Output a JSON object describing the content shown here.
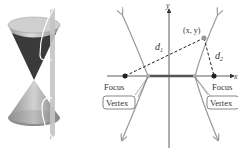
{
  "figure": {
    "left_panel": {
      "description": "Double cone intersected by a vertical plane producing a hyperbola",
      "colors": {
        "cone_light": "#d8d8d8",
        "cone_mid": "#a9a9a9",
        "cone_dark": "#3a3a3a",
        "plane": "#c9c9c9",
        "curve": "#ffffff"
      }
    },
    "right_panel": {
      "axis_labels": {
        "x": "x",
        "y": "y"
      },
      "point_label": "(x, y)",
      "distance_labels": {
        "d1": "d",
        "d1_sub": "1",
        "d2": "d",
        "d2_sub": "2"
      },
      "left_focus_label": "Focus",
      "right_focus_label": "Focus",
      "left_vertex_label": "Vertex",
      "right_vertex_label": "Vertex",
      "colors": {
        "axis": "#333333",
        "curve": "#9a9a9a",
        "transverse_axis": "#555555",
        "dashed": "#222222",
        "focus": "#222222",
        "vertex": "#aaaaaa"
      }
    }
  }
}
